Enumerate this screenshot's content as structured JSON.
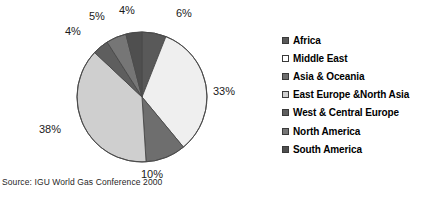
{
  "chart_data": {
    "type": "pie",
    "title": "",
    "labels": [
      "Africa",
      "Middle East",
      "Asia & Oceania",
      "East Europe &North Asia",
      "West & Central Europe",
      "North America",
      "South America"
    ],
    "values": [
      6,
      33,
      10,
      38,
      4,
      5,
      4
    ],
    "value_labels": [
      "6%",
      "33%",
      "10%",
      "38%",
      "4%",
      "5%",
      "4%"
    ],
    "colors": [
      "#595959",
      "#efefef",
      "#6e6e6e",
      "#cfcfcf",
      "#5e5e5e",
      "#767676",
      "#4f4f4f"
    ],
    "start_angle_deg": 0,
    "direction": "clockwise",
    "legend_position": "right",
    "grid": false,
    "source": "Source: IGU World Gas Conference 2000"
  },
  "legend": {
    "items": [
      {
        "label": "Africa",
        "swatch": "#595959"
      },
      {
        "label": "Middle East",
        "swatch": "#ffffff"
      },
      {
        "label": "Asia & Oceania",
        "swatch": "#6e6e6e"
      },
      {
        "label": "East Europe &North Asia",
        "swatch": "#cfcfcf"
      },
      {
        "label": "West & Central Europe",
        "swatch": "#5e5e5e"
      },
      {
        "label": "North America",
        "swatch": "#767676"
      },
      {
        "label": "South America",
        "swatch": "#4f4f4f"
      }
    ]
  },
  "labels_on_chart": {
    "africa": "6%",
    "middle_east": "33%",
    "asia_oceania": "10%",
    "east_europe_north_asia": "38%",
    "west_central_europe": "4%",
    "north_america": "5%",
    "south_america": "4%"
  },
  "footer": {
    "source": "Source: IGU World Gas Conference 2000"
  }
}
